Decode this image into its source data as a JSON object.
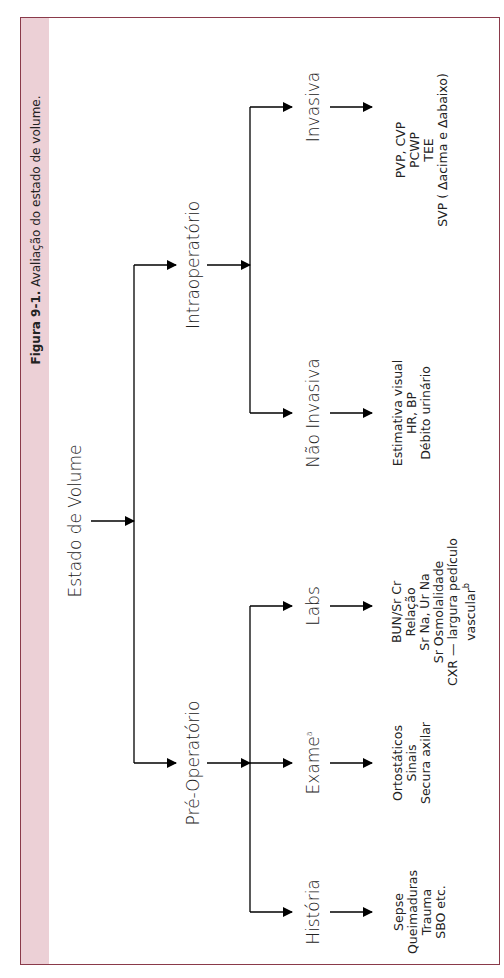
{
  "figure": {
    "caption_label": "Figura 9-1.",
    "caption_text": " Avaliação do estado de volume.",
    "accent_color": "#ecd0d6",
    "border_color": "#8a3a4a"
  },
  "root": {
    "label": "Estado de Volume"
  },
  "branches": {
    "intra": {
      "label": "Intraoperatório",
      "children": {
        "invasiva": {
          "label": "Invasiva",
          "items": [
            "PVP, CVP",
            "PCWP",
            "TEE",
            "SVP ( Δacima e  Δabaixo)"
          ]
        },
        "nao_invasiva": {
          "label": "Não Invasiva",
          "items": [
            "Estimativa visual",
            "HR, BP",
            "Débito urinário"
          ]
        }
      }
    },
    "pre": {
      "label": "Pré-Operatório",
      "children": {
        "labs": {
          "label": "Labs",
          "items": [
            "BUN/Sr Cr",
            "Relação",
            "Sr Na, Ur Na",
            "Sr Osmolalidade",
            "CXR — largura pedículo",
            "vascular"
          ],
          "last_sup": "b"
        },
        "exame": {
          "label": "Exame",
          "sup": "a",
          "items": [
            "Ortostáticos",
            "Sinais",
            "Secura axilar"
          ]
        },
        "historia": {
          "label": "História",
          "items": [
            "Sepse",
            "Queimaduras",
            "Trauma",
            "SBO etc."
          ]
        }
      }
    }
  }
}
